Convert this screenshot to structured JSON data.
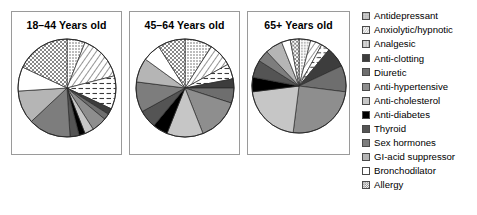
{
  "figure": {
    "type": "pie-chart-panel-series",
    "background": "#ffffff"
  },
  "legend": {
    "position": "right",
    "items": [
      {
        "label": "Antidepressant",
        "key": "antidepressant",
        "fill": "#d8d8d8",
        "pattern": "fine-dots",
        "stroke": "#4a4a4a"
      },
      {
        "label": "Anxiolytic/hypnotic",
        "key": "anxiolytic",
        "fill": "#ffffff",
        "pattern": "diagonal-left",
        "stroke": "#4a4a4a"
      },
      {
        "label": "Analgesic",
        "key": "analgesic",
        "fill": "#ffffff",
        "pattern": "horizontal-dash",
        "stroke": "#4a4a4a"
      },
      {
        "label": "Anti-clotting",
        "key": "anti-clotting",
        "fill": "#3d3d3d",
        "pattern": "solid",
        "stroke": "#4a4a4a"
      },
      {
        "label": "Diuretic",
        "key": "diuretic",
        "fill": "#6e6e6e",
        "pattern": "solid",
        "stroke": "#4a4a4a"
      },
      {
        "label": "Anti-hypertensive",
        "key": "anti-hypertensive",
        "fill": "#8e8e8e",
        "pattern": "solid",
        "stroke": "#4a4a4a"
      },
      {
        "label": "Anti-cholesterol",
        "key": "anti-cholesterol",
        "fill": "#c6c6c6",
        "pattern": "solid",
        "stroke": "#4a4a4a"
      },
      {
        "label": "Anti-diabetes",
        "key": "anti-diabetes",
        "fill": "#000000",
        "pattern": "solid",
        "stroke": "#4a4a4a"
      },
      {
        "label": "Thyroid",
        "key": "thyroid",
        "fill": "#545454",
        "pattern": "solid",
        "stroke": "#4a4a4a"
      },
      {
        "label": "Sex hormones",
        "key": "sex-hormones",
        "fill": "#7d7d7d",
        "pattern": "solid",
        "stroke": "#4a4a4a"
      },
      {
        "label": "GI-acid suppressor",
        "key": "gi-acid",
        "fill": "#b5b5b5",
        "pattern": "solid",
        "stroke": "#4a4a4a"
      },
      {
        "label": "Bronchodilator",
        "key": "bronchodilator",
        "fill": "#ffffff",
        "pattern": "solid",
        "stroke": "#4a4a4a"
      },
      {
        "label": "Allergy",
        "key": "allergy",
        "fill": "#ffffff",
        "pattern": "crosshatch",
        "stroke": "#4a4a4a"
      }
    ]
  },
  "chart_data": {
    "type": "pie",
    "title": "",
    "legend_position": "right",
    "shared_categories": [
      "Antidepressant",
      "Anxiolytic/hypnotic",
      "Analgesic",
      "Anti-clotting",
      "Diuretic",
      "Anti-hypertensive",
      "Anti-cholesterol",
      "Anti-diabetes",
      "Thyroid",
      "Sex hormones",
      "GI-acid suppressor",
      "Bronchodilator",
      "Allergy"
    ],
    "units": "percent",
    "start_angle_deg": 0,
    "direction": "clockwise",
    "panels": [
      {
        "id": "panel-0",
        "title": "18–44 Years old",
        "values": [
          6,
          15,
          11,
          2,
          2,
          5,
          3,
          2,
          3,
          14,
          11,
          8,
          18
        ]
      },
      {
        "id": "panel-1",
        "title": "45–64 Years old",
        "values": [
          9,
          8,
          5,
          3,
          5,
          14,
          12,
          5,
          6,
          10,
          8,
          6,
          9
        ]
      },
      {
        "id": "panel-2",
        "title": "65+ Years old",
        "values": [
          4,
          4,
          3,
          7,
          9,
          25,
          21,
          5,
          6,
          4,
          6,
          3,
          3
        ]
      }
    ]
  }
}
